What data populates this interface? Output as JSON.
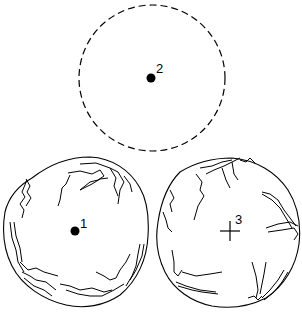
{
  "diagram": {
    "colors": {
      "stroke": "#000000",
      "background": "#ffffff"
    },
    "figures": [
      {
        "id": "top-circle",
        "style": "dashed-circle",
        "center": [
          152,
          78
        ],
        "radius": 73,
        "marker": {
          "type": "dot",
          "label": "2"
        }
      },
      {
        "id": "bottom-left-sphere",
        "style": "cracked-sphere",
        "center": [
          75,
          232
        ],
        "radius": 74,
        "marker": {
          "type": "dot",
          "label": "1"
        }
      },
      {
        "id": "bottom-right-sphere",
        "style": "cracked-sphere",
        "center": [
          229,
          232
        ],
        "radius": 73,
        "marker": {
          "type": "cross",
          "label": "3"
        }
      }
    ]
  }
}
